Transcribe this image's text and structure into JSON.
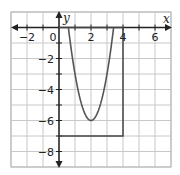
{
  "chart_data": {
    "type": "line",
    "title": "",
    "xlabel": "x",
    "ylabel": "y",
    "xlim": [
      -3,
      7
    ],
    "ylim": [
      -9,
      1
    ],
    "grid": true,
    "x_ticks": [
      -2,
      0,
      2,
      4,
      6
    ],
    "y_ticks": [
      -2,
      -4,
      -6,
      -8
    ],
    "x_tick_labels": [
      "−2",
      "0",
      "2",
      "4",
      "6"
    ],
    "y_tick_labels": [
      "−2",
      "−4",
      "−6",
      "−8"
    ],
    "series": [
      {
        "name": "parabola",
        "equation": "y = 3(x - 2)^2 - 6",
        "vertex": [
          2,
          -6
        ],
        "x_intercepts": [
          0.59,
          3.41
        ],
        "x_range": [
          0.59,
          3.41
        ],
        "color": "#555555"
      },
      {
        "name": "rectangle",
        "points": [
          [
            0,
            0
          ],
          [
            4,
            0
          ],
          [
            4,
            -7
          ],
          [
            0,
            -7
          ]
        ],
        "color": "#444444"
      }
    ]
  },
  "colors": {
    "grid": "#c8c8c8",
    "axis": "#222222",
    "curve": "#555555",
    "border": "#bdbdbd"
  }
}
